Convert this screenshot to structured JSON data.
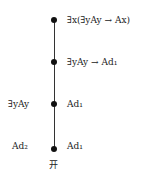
{
  "tree": {
    "nodes": [
      {
        "right": "∃x(∃yAy → Ax)",
        "left": ""
      },
      {
        "right": "∃yAy → Ad₁",
        "left": ""
      },
      {
        "right": "Ad₁",
        "left": "∃yAy"
      },
      {
        "right": "Ad₁",
        "left": "Ad₂"
      }
    ],
    "closure_mark": "开"
  }
}
